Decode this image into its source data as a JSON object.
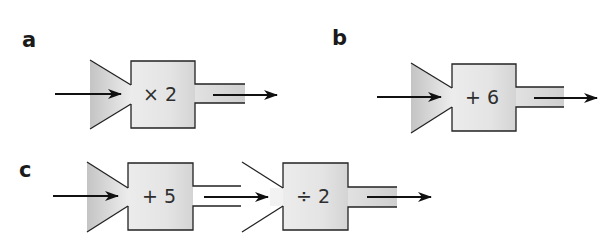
{
  "parts": [
    {
      "label": "a",
      "machines": [
        {
          "operation": "× 2",
          "funnel_shaded": true,
          "spout_shaded": true
        }
      ]
    },
    {
      "label": "b",
      "machines": [
        {
          "operation": "+ 6",
          "funnel_shaded": true,
          "spout_shaded": true
        }
      ]
    },
    {
      "label": "c",
      "machines": [
        {
          "operation": "+ 5",
          "funnel_shaded": true,
          "spout_shaded": false
        },
        {
          "operation": "÷ 2",
          "funnel_shaded": false,
          "spout_shaded": true
        }
      ]
    }
  ],
  "colors": {
    "outline": "#222222",
    "arrow": "#111111",
    "funnel_dark": "#c4c4c4",
    "funnel_light": "#ececec",
    "box_light": "#ececec",
    "box_dark": "#d6d6d6",
    "label": "#1a1a1a"
  }
}
